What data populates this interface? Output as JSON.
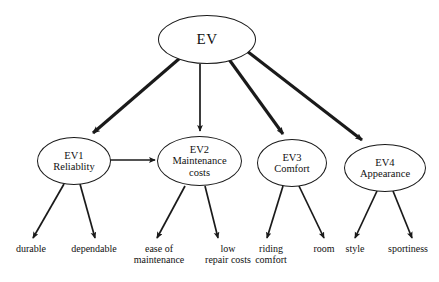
{
  "diagram": {
    "type": "hierarchy-tree",
    "title_node": {
      "id": "EV",
      "label": "EV"
    },
    "criteria": [
      {
        "id": "EV1",
        "code": "EV1",
        "name": "Reliablity",
        "line1": "EV1",
        "line2": "Reliablity"
      },
      {
        "id": "EV2",
        "code": "EV2",
        "name": "Maintenance costs",
        "line1": "EV2",
        "line2": "Maintenance",
        "line3": "costs"
      },
      {
        "id": "EV3",
        "code": "EV3",
        "name": "Comfort",
        "line1": "EV3",
        "line2": "Comfort"
      },
      {
        "id": "EV4",
        "code": "EV4",
        "name": "Appearance",
        "line1": "EV4",
        "line2": "Appearance"
      }
    ],
    "leaves": [
      {
        "id": "durable",
        "parent": "EV1",
        "line1": "durable",
        "line2": ""
      },
      {
        "id": "dependable",
        "parent": "EV1",
        "line1": "dependable",
        "line2": ""
      },
      {
        "id": "ease-of-maintenance",
        "parent": "EV2",
        "line1": "ease of",
        "line2": "maintenance"
      },
      {
        "id": "low-repair-costs",
        "parent": "EV2",
        "line1": "low",
        "line2": "repair costs"
      },
      {
        "id": "riding-comfort",
        "parent": "EV3",
        "line1": "riding",
        "line2": "comfort"
      },
      {
        "id": "room",
        "parent": "EV3",
        "line1": "room",
        "line2": ""
      },
      {
        "id": "style",
        "parent": "EV4",
        "line1": "style",
        "line2": ""
      },
      {
        "id": "sportiness",
        "parent": "EV4",
        "line1": "sportiness",
        "line2": ""
      }
    ],
    "colors": {
      "stroke": "#1a1a1a",
      "text": "#111111",
      "background": "#ffffff"
    }
  }
}
